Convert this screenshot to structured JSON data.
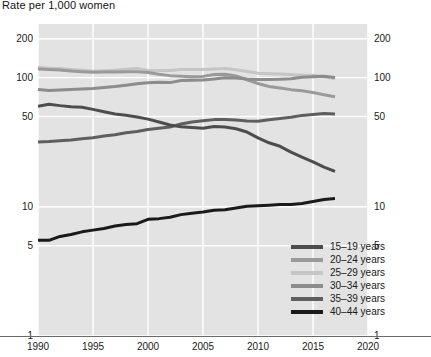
{
  "chart_data": {
    "type": "line",
    "title": "Rate per 1,000 women",
    "xlabel": "",
    "ylabel": "",
    "yscale": "log",
    "ylim": [
      1,
      260
    ],
    "xlim": [
      1990,
      2020
    ],
    "grid": true,
    "y_ticks": [
      1,
      5,
      10,
      50,
      100,
      200
    ],
    "y_tick_labels": [
      "1",
      "5",
      "10",
      "50",
      "100",
      "200"
    ],
    "x_ticks": [
      1990,
      1995,
      2000,
      2005,
      2010,
      2015,
      2020
    ],
    "x_tick_labels": [
      "1990",
      "1995",
      "2000",
      "2005",
      "2010",
      "2015",
      "2020"
    ],
    "legend_position": "inside-lower-right",
    "x": [
      1990,
      1991,
      1992,
      1993,
      1994,
      1995,
      1996,
      1997,
      1998,
      1999,
      2000,
      2001,
      2002,
      2003,
      2004,
      2005,
      2006,
      2007,
      2008,
      2009,
      2010,
      2011,
      2012,
      2013,
      2014,
      2015,
      2016,
      2017
    ],
    "series": [
      {
        "name": "15–19 years",
        "color": "#4d4d4d",
        "values": [
          59.9,
          62.1,
          60.7,
          59.6,
          58.9,
          56.8,
          54.4,
          52.3,
          51.1,
          49.6,
          47.7,
          45.3,
          43.0,
          41.6,
          41.1,
          40.5,
          41.9,
          41.5,
          40.2,
          37.9,
          34.2,
          31.3,
          29.4,
          26.5,
          24.2,
          22.3,
          20.3,
          18.8
        ]
      },
      {
        "name": "20–24 years",
        "color": "#9a9a9a",
        "values": [
          116.5,
          115.7,
          114.6,
          112.6,
          111.1,
          109.8,
          110.4,
          110.4,
          111.2,
          111.0,
          109.7,
          106.2,
          103.6,
          102.6,
          101.7,
          102.2,
          105.9,
          106.3,
          103.0,
          96.3,
          90.0,
          85.3,
          83.1,
          80.7,
          79.0,
          76.8,
          73.8,
          71.0
        ]
      },
      {
        "name": "25–29 years",
        "color": "#c5c5c5",
        "values": [
          120.2,
          118.2,
          117.4,
          115.5,
          113.9,
          112.2,
          113.1,
          113.8,
          115.9,
          117.8,
          113.5,
          113.4,
          113.6,
          115.6,
          115.5,
          115.5,
          116.7,
          117.5,
          115.1,
          111.5,
          108.3,
          107.2,
          106.5,
          105.5,
          104.2,
          104.3,
          101.9,
          97.9
        ]
      },
      {
        "name": "30–34 years",
        "color": "#8c8c8c",
        "values": [
          80.8,
          79.5,
          80.2,
          80.8,
          81.5,
          82.5,
          83.9,
          85.3,
          87.4,
          89.6,
          91.2,
          91.9,
          91.5,
          95.1,
          95.3,
          95.8,
          97.7,
          99.9,
          99.3,
          97.5,
          96.5,
          96.5,
          97.3,
          98.0,
          100.8,
          101.5,
          102.6,
          100.3
        ]
      },
      {
        "name": "35–39 years",
        "color": "#5e5e5e",
        "values": [
          31.7,
          32.0,
          32.5,
          32.9,
          33.7,
          34.3,
          35.3,
          36.1,
          37.4,
          38.3,
          39.7,
          40.6,
          41.4,
          43.8,
          45.4,
          46.3,
          47.3,
          47.5,
          46.9,
          46.1,
          45.9,
          47.2,
          48.3,
          49.3,
          51.0,
          51.8,
          52.7,
          52.2
        ]
      },
      {
        "name": "40–44 years",
        "color": "#1a1a1a",
        "values": [
          5.5,
          5.5,
          5.9,
          6.1,
          6.4,
          6.6,
          6.8,
          7.1,
          7.3,
          7.4,
          8.0,
          8.1,
          8.3,
          8.7,
          8.9,
          9.1,
          9.4,
          9.5,
          9.8,
          10.1,
          10.2,
          10.3,
          10.4,
          10.4,
          10.6,
          11.0,
          11.4,
          11.6
        ]
      }
    ]
  },
  "title": {
    "text": "Rate per 1,000 women"
  },
  "legend": {
    "items": [
      {
        "label": "15–19 years",
        "color": "#4d4d4d"
      },
      {
        "label": "20–24 years",
        "color": "#9a9a9a"
      },
      {
        "label": "25–29 years",
        "color": "#c5c5c5"
      },
      {
        "label": "30–34 years",
        "color": "#8c8c8c"
      },
      {
        "label": "35–39 years",
        "color": "#5e5e5e"
      },
      {
        "label": "40–44 years",
        "color": "#1a1a1a"
      }
    ]
  },
  "axes": {
    "y_left": [
      "200",
      "100",
      "50",
      "10",
      "5",
      "1"
    ],
    "y_right": [
      "200",
      "100",
      "50",
      "10",
      "5",
      "1"
    ],
    "x": [
      "1990",
      "1995",
      "2000",
      "2005",
      "2010",
      "2015",
      "2020"
    ]
  },
  "colors": {
    "plot_background": "#e3e3e3",
    "gridline": "#ffffff",
    "axis_line": "#6a6a6a",
    "text": "#1a1a1a"
  }
}
